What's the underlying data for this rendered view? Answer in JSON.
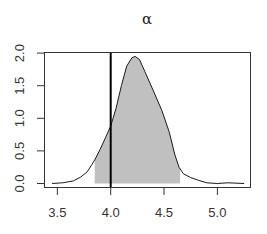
{
  "chart_data": {
    "type": "area",
    "title": "α",
    "xlabel": "",
    "ylabel": "",
    "xlim": [
      3.4,
      5.3
    ],
    "ylim": [
      -0.07,
      2.07
    ],
    "x_ticks": [
      "3.5",
      "4.0",
      "4.5",
      "5.0"
    ],
    "x_tick_values": [
      3.5,
      4.0,
      4.5,
      5.0
    ],
    "y_ticks": [
      "0.0",
      "0.5",
      "1.0",
      "1.5",
      "2.0"
    ],
    "y_tick_values": [
      0.0,
      0.5,
      1.0,
      1.5,
      2.0
    ],
    "grid": false,
    "legend": null,
    "series": [
      {
        "name": "posterior density",
        "x": [
          3.45,
          3.55,
          3.65,
          3.72,
          3.78,
          3.82,
          3.85,
          3.9,
          3.95,
          4.0,
          4.05,
          4.1,
          4.15,
          4.2,
          4.23,
          4.27,
          4.32,
          4.4,
          4.48,
          4.55,
          4.6,
          4.64,
          4.68,
          4.75,
          4.82,
          4.9,
          5.0,
          5.1,
          5.25
        ],
        "values": [
          0.0,
          0.01,
          0.04,
          0.1,
          0.18,
          0.28,
          0.36,
          0.52,
          0.7,
          0.88,
          1.15,
          1.5,
          1.8,
          1.93,
          1.95,
          1.9,
          1.72,
          1.42,
          1.12,
          0.78,
          0.45,
          0.25,
          0.15,
          0.09,
          0.05,
          0.01,
          0.0,
          0.01,
          0.0
        ]
      }
    ],
    "shaded_interval": {
      "from": 3.85,
      "to": 4.65,
      "color": "#c0c0c0"
    },
    "reference_line": {
      "x": 4.0,
      "color": "#000000"
    }
  },
  "colors": {
    "fill": "#c0c0c0",
    "curve": "#1a1a1a",
    "axis": "#333333",
    "reference_line": "#000000"
  }
}
